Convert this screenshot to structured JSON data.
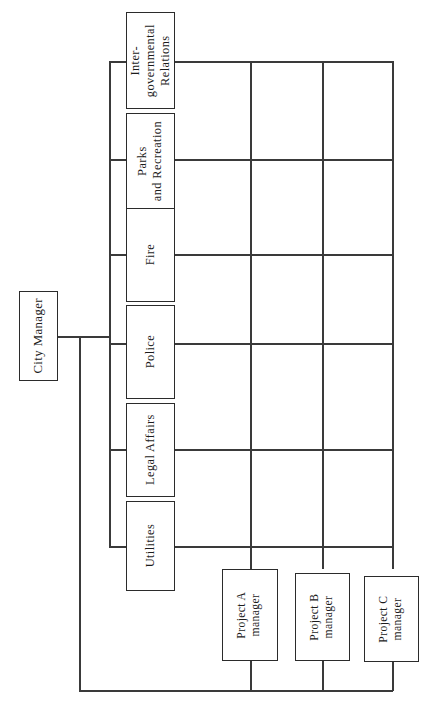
{
  "chart": {
    "orientation": "rotated-90-ccw",
    "background_color": "#ffffff",
    "line_color": "#3a3a3a",
    "box_border_color": "#2b2b2b",
    "text_color": "#1c1c1c"
  },
  "root": {
    "label": "City Manager"
  },
  "departments": [
    {
      "label": "Inter-\ngovernmental\nRelations"
    },
    {
      "label": "Parks\nand Recreation"
    },
    {
      "label": "Fire"
    },
    {
      "label": "Police"
    },
    {
      "label": "Legal Affairs"
    },
    {
      "label": "Utilities"
    }
  ],
  "projects": [
    {
      "label": "Project A\nmanager"
    },
    {
      "label": "Project B\nmanager"
    },
    {
      "label": "Project C\nmanager"
    }
  ]
}
